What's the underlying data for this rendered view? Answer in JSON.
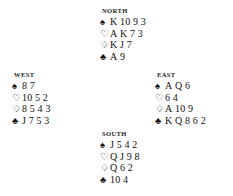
{
  "diagram": {
    "type": "bridge-deal",
    "suit_glyphs": {
      "spades": "♠",
      "hearts": "♡",
      "diamonds": "♢",
      "clubs": "♣"
    },
    "suit_order": [
      "spades",
      "hearts",
      "diamonds",
      "clubs"
    ],
    "colors": {
      "text": "#111111",
      "background": "#ffffff"
    },
    "hands": {
      "north": {
        "label": "NORTH",
        "position": "north",
        "suits": {
          "spades": "K 10 9 3",
          "hearts": "A K 7 3",
          "diamonds": "K J 7",
          "clubs": "A 9"
        }
      },
      "west": {
        "label": "WEST",
        "position": "west",
        "suits": {
          "spades": "8 7",
          "hearts": "10 5 2",
          "diamonds": "8 5 4 3",
          "clubs": "J 7 5 3"
        }
      },
      "east": {
        "label": "EAST",
        "position": "east",
        "suits": {
          "spades": "A Q 6",
          "hearts": "6 4",
          "diamonds": "A 10 9",
          "clubs": "K Q 8 6 2"
        }
      },
      "south": {
        "label": "SOUTH",
        "position": "south",
        "suits": {
          "spades": "J 5 4 2",
          "hearts": "Q J 9 8",
          "diamonds": "Q 6 2",
          "clubs": "10 4"
        }
      }
    }
  }
}
